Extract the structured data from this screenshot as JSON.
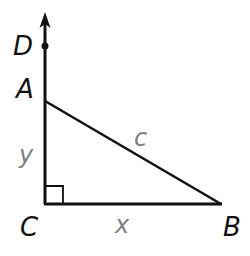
{
  "diagram": {
    "type": "right-triangle",
    "vertices": {
      "A": {
        "label": "A",
        "x": 45,
        "y": 101
      },
      "B": {
        "label": "B",
        "x": 221,
        "y": 204
      },
      "C": {
        "label": "C",
        "x": 45,
        "y": 204
      },
      "D": {
        "label": "D",
        "x": 45,
        "y": 47
      }
    },
    "sides": {
      "AC": {
        "label": "y"
      },
      "CB": {
        "label": "x"
      },
      "AB": {
        "label": "c"
      }
    },
    "ray": {
      "from": "C",
      "through": "D",
      "arrow": true
    },
    "right_angle_at": "C",
    "colors": {
      "lines": "#111111",
      "vertex_labels": "#111111",
      "side_labels": "#808080"
    }
  }
}
